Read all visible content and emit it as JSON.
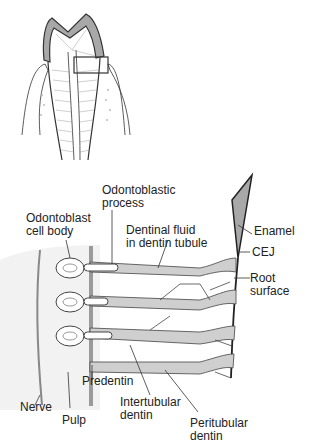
{
  "diagram": {
    "title_inset": "Tooth cross-section with highlighted region",
    "labels": {
      "odontoblastic_process": "Odontoblastic\nprocess",
      "odontoblast_cell_body": "Odontoblast\ncell body",
      "dentinal_fluid": "Dentinal fluid\nin dentin tubule",
      "enamel": "Enamel",
      "cej": "CEJ",
      "root_surface": "Root\nsurface",
      "predentin": "Predentin",
      "nerve": "Nerve",
      "pulp": "Pulp",
      "intertubular_dentin": "Intertubular\ndentin",
      "peritubular_dentin": "Peritubular\ndentin"
    },
    "colors": {
      "enamel": "#a8a8a8",
      "tubule_fluid": "#cfcfcf",
      "predentin": "#9a9a9a",
      "pulp_bg": "#f2f2f2",
      "line": "#333333"
    }
  }
}
